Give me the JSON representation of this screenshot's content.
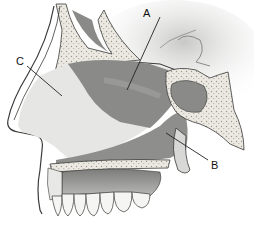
{
  "figure": {
    "type": "anatomical-diagram",
    "labels": [
      {
        "id": "A",
        "text": "A",
        "x": 143,
        "y": 8,
        "line": [
          [
            160,
            17
          ],
          [
            127,
            90
          ]
        ]
      },
      {
        "id": "B",
        "text": "B",
        "x": 211,
        "y": 160,
        "line": [
          [
            208,
            160
          ],
          [
            166,
            133
          ]
        ]
      },
      {
        "id": "C",
        "text": "C",
        "x": 16,
        "y": 56,
        "line": [
          [
            27,
            66
          ],
          [
            62,
            96
          ]
        ]
      }
    ],
    "colors": {
      "background": "#ffffff",
      "bone": "#ece9e2",
      "bone_dots": "#9a978f",
      "soft_tissue": "#8a8a88",
      "cavity_light": "#e6e6e4",
      "outline": "#3a3a38",
      "gum": "#9a9a98",
      "teeth": "#f5f5f3"
    }
  }
}
